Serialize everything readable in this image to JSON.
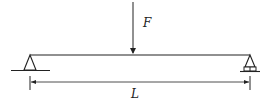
{
  "diagram": {
    "type": "simply-supported-beam",
    "colors": {
      "line": "#222222",
      "background": "#ffffff"
    },
    "beam": {
      "x1": 30,
      "x2": 250,
      "y": 55
    },
    "supports": [
      {
        "kind": "pin",
        "position": "left",
        "x": 30
      },
      {
        "kind": "roller",
        "position": "right",
        "x": 250
      }
    ],
    "load": {
      "label": "F",
      "x": 133,
      "direction": "down"
    },
    "dimension": {
      "label": "L",
      "from": 30,
      "to": 250,
      "y": 82
    }
  }
}
